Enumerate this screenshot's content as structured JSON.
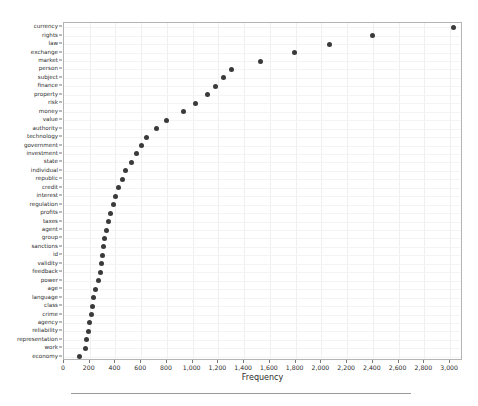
{
  "chart_data": {
    "type": "scatter",
    "title": "",
    "xlabel": "Frequency",
    "ylabel": "",
    "xlim": [
      0,
      3100
    ],
    "ylim": [
      0,
      38
    ],
    "grid": true,
    "legend": null,
    "orientation": "horizontal",
    "x_ticks": [
      0,
      200,
      400,
      600,
      800,
      1000,
      1200,
      1400,
      1600,
      1800,
      2000,
      2200,
      2400,
      2600,
      2800,
      3000
    ],
    "x_tick_labels": [
      "0",
      "200",
      "400",
      "600",
      "800",
      "1,000",
      "1,200",
      "1,400",
      "1,600",
      "1,800",
      "2,000",
      "2,200",
      "2,400",
      "2,600",
      "2,800",
      "3,000"
    ],
    "categories": [
      "currency",
      "rights",
      "law",
      "exchange",
      "market",
      "person",
      "subject",
      "finance",
      "property",
      "risk",
      "money",
      "value",
      "authority",
      "technology",
      "government",
      "investment",
      "state",
      "individual",
      "republic",
      "credit",
      "interest",
      "regulation",
      "profits",
      "taxes",
      "agent",
      "group",
      "sanctions",
      "id",
      "validity",
      "feedback",
      "power",
      "age",
      "language",
      "class",
      "crime",
      "agency",
      "reliability",
      "representation",
      "work",
      "economy"
    ],
    "values": [
      3030,
      2395,
      2060,
      1790,
      1530,
      1300,
      1240,
      1175,
      1115,
      1020,
      930,
      800,
      720,
      640,
      600,
      565,
      525,
      480,
      455,
      420,
      400,
      382,
      360,
      345,
      330,
      318,
      308,
      300,
      292,
      282,
      270,
      245,
      232,
      218,
      210,
      200,
      190,
      178,
      168,
      118
    ],
    "marker": {
      "shape": "circle",
      "color": "#3a3a3a",
      "size": 5
    },
    "colors": {
      "axis": "#b4b4b4",
      "grid": "#f0f0f0",
      "text": "#2b2b2b",
      "background": "#ffffff",
      "rule": "#9a9a9a"
    }
  }
}
